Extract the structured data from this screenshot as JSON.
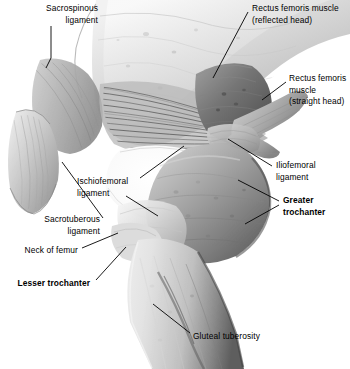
{
  "figure": {
    "background_color": "#ffffff",
    "width": 350,
    "height": 369
  },
  "labels": [
    {
      "id": "sacrospinous-ligament",
      "lines": [
        "Sacrospinous",
        "ligament"
      ],
      "text": "Sacrospinous ligament",
      "bold": false,
      "align": "right",
      "x": 98,
      "y": 3
    },
    {
      "id": "rectus-femoris-reflected-head",
      "lines": [
        "Rectus femoris muscle",
        "(reflected head)"
      ],
      "text": "Rectus femoris muscle (reflected head)",
      "bold": false,
      "align": "left",
      "x": 252,
      "y": 3
    },
    {
      "id": "rectus-femoris-straight-head",
      "lines": [
        "Rectus femoris",
        "muscle",
        "(straight head)"
      ],
      "text": "Rectus femoris muscle (straight head)",
      "bold": false,
      "align": "left",
      "x": 289,
      "y": 73
    },
    {
      "id": "iliofemoral-ligament",
      "lines": [
        "Iliofemoral",
        "ligament"
      ],
      "text": "Iliofemoral ligament",
      "bold": false,
      "align": "left",
      "x": 276,
      "y": 160
    },
    {
      "id": "greater-trochanter",
      "lines": [
        "Greater",
        "trochanter"
      ],
      "text": "Greater trochanter",
      "bold": true,
      "align": "left",
      "x": 283,
      "y": 195
    },
    {
      "id": "ischiofemoral-ligament",
      "lines": [
        "Ischiofemoral",
        "ligament"
      ],
      "text": "Ischiofemoral ligament",
      "bold": false,
      "align": "left",
      "x": 77,
      "y": 176
    },
    {
      "id": "sacrotuberous-ligament",
      "lines": [
        "Sacrotuberous",
        "ligament"
      ],
      "text": "Sacrotuberous ligament",
      "bold": false,
      "align": "right",
      "x": 100,
      "y": 214
    },
    {
      "id": "neck-of-femur",
      "lines": [
        "Neck of femur"
      ],
      "text": "Neck of femur",
      "bold": false,
      "align": "right",
      "x": 78,
      "y": 245
    },
    {
      "id": "lesser-trochanter",
      "lines": [
        "Lesser trochanter"
      ],
      "text": "Lesser trochanter",
      "bold": true,
      "align": "right",
      "x": 90,
      "y": 278
    },
    {
      "id": "gluteal-tuberosity",
      "lines": [
        "Gluteal tuberosity"
      ],
      "text": "Gluteal tuberosity",
      "bold": false,
      "align": "left",
      "x": 193,
      "y": 331
    }
  ],
  "leader_lines": [
    {
      "id": "leader-sacrospinous-ligament",
      "points": "51,26 51,58 46,68"
    },
    {
      "id": "leader-rectus-femoris-reflected-head",
      "points": "248,12 213,78"
    },
    {
      "id": "leader-rectus-femoris-straight-head",
      "points": "286,82 262,100"
    },
    {
      "id": "leader-iliofemoral-ligament",
      "points": "272,166 228,139"
    },
    {
      "id": "leader-greater-trochanter-upper",
      "points": "279,202 238,180"
    },
    {
      "id": "leader-greater-trochanter-lower",
      "points": "279,204 245,224"
    },
    {
      "id": "leader-ischiofemoral-ligament",
      "points": "136,180 184,146"
    },
    {
      "id": "leader-ischiofemoral-ligament-2",
      "points": "124,196 156,215"
    },
    {
      "id": "leader-sacrotuberous-ligament",
      "points": "103,220 62,162"
    },
    {
      "id": "leader-neck-of-femur",
      "points": "82,248 118,233"
    },
    {
      "id": "leader-lesser-trochanter",
      "points": "94,281 124,248"
    },
    {
      "id": "leader-gluteal-tuberosity",
      "points": "190,334 153,305"
    }
  ],
  "colors": {
    "background": "#ffffff",
    "label_text": "#000000",
    "leader_line": "#000000",
    "bone_light": "#e3e3e3",
    "bone_mid": "#bdbdbd",
    "bone_shadow": "#8a8a8a",
    "bone_dark": "#5c5c5c",
    "muscle_dark": "#6d6d6d",
    "ligament_fiber": "#4a4a4a"
  },
  "structures": [
    {
      "id": "ilium",
      "name": "Ilium / pelvic bone",
      "tone": "light gray"
    },
    {
      "id": "sacrospinous-ligament-band",
      "name": "Sacrospinous ligament band",
      "tone": "mid gray striated"
    },
    {
      "id": "sacrotuberous-ligament-band",
      "name": "Sacrotuberous ligament band",
      "tone": "light gray striated"
    },
    {
      "id": "ischiofemoral-ligament-fibers",
      "name": "Ischiofemoral ligament fan fibers",
      "tone": "dark striated"
    },
    {
      "id": "iliofemoral-ligament-band",
      "name": "Iliofemoral ligament",
      "tone": "mid gray"
    },
    {
      "id": "rectus-femoris-reflected",
      "name": "Rectus femoris reflected head",
      "tone": "dark gray muscle"
    },
    {
      "id": "rectus-femoris-straight",
      "name": "Rectus femoris straight head tendon",
      "tone": "mid gray"
    },
    {
      "id": "greater-trochanter-mass",
      "name": "Greater trochanter",
      "tone": "mid-dark gray"
    },
    {
      "id": "femoral-neck",
      "name": "Neck of femur",
      "tone": "light gray"
    },
    {
      "id": "lesser-trochanter-mass",
      "name": "Lesser trochanter",
      "tone": "light gray"
    },
    {
      "id": "femoral-shaft",
      "name": "Shaft of femur",
      "tone": "light gray with dark edge"
    },
    {
      "id": "gluteal-tuberosity-ridge",
      "name": "Gluteal tuberosity ridge",
      "tone": "dark gray"
    }
  ]
}
